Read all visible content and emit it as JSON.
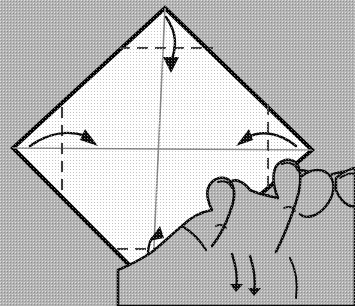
{
  "figure": {
    "background_color": "#b4b4b4",
    "paper_fill": "#ffffff",
    "ink_color": "#000000",
    "crease_color": "#555555",
    "sheet": {
      "shape": "diamond",
      "vertices": {
        "top": [
          165,
          8
        ],
        "left": [
          13,
          148
        ],
        "right": [
          312,
          150
        ],
        "bottom": [
          152,
          288
        ]
      },
      "outline_width": 4
    },
    "center_lines": [
      {
        "name": "vertical-center-line",
        "from": [
          165,
          8
        ],
        "to": [
          152,
          288
        ]
      },
      {
        "name": "horizontal-center-line",
        "from": [
          13,
          148
        ],
        "to": [
          312,
          150
        ]
      }
    ],
    "crease_lines": [
      {
        "name": "top-crease-dashed",
        "orientation": "horizontal",
        "y": 48,
        "x1": 119,
        "x2": 213
      },
      {
        "name": "bottom-crease-dashed",
        "orientation": "horizontal",
        "y": 249,
        "x1": 117,
        "x2": 219
      },
      {
        "name": "left-crease-dashed",
        "orientation": "vertical",
        "x": 62,
        "y1": 107,
        "y2": 196
      },
      {
        "name": "right-crease-dashed",
        "orientation": "vertical",
        "x": 268,
        "y1": 104,
        "y2": 197
      }
    ],
    "fold_arrows": [
      {
        "name": "fold-arrow-top",
        "direction": "down",
        "label": "fold top corner down to center"
      },
      {
        "name": "fold-arrow-left",
        "direction": "right",
        "label": "fold left corner right to center"
      },
      {
        "name": "fold-arrow-right",
        "direction": "left",
        "label": "fold right corner left to center"
      },
      {
        "name": "fold-arrow-bottom",
        "direction": "up",
        "label": "fold bottom corner up to center"
      }
    ],
    "hand": {
      "name": "hand-illustration",
      "position": "lower-right",
      "description": "line-drawn right hand with four fingers holding the paper edge",
      "finger_count": 4
    },
    "caption": {
      "visible": false,
      "text": ""
    }
  }
}
